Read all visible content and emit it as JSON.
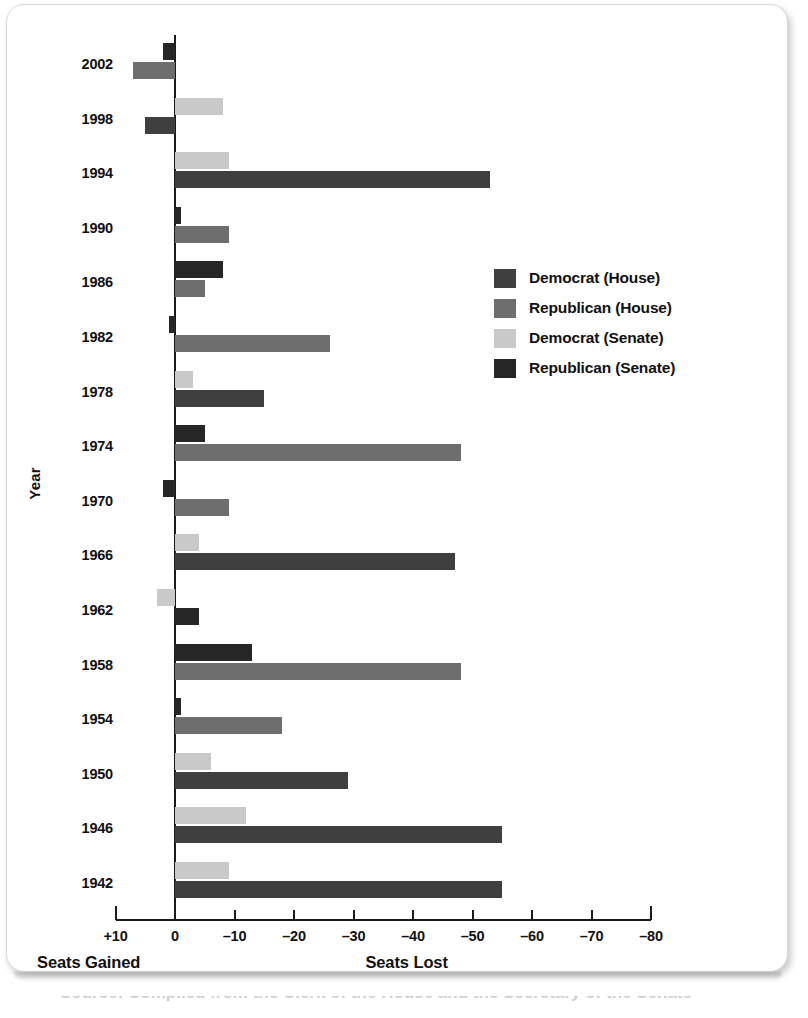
{
  "chart_data": {
    "type": "bar",
    "orientation": "horizontal",
    "title": "",
    "xlabel_left": "Seats Gained",
    "xlabel_right": "Seats Lost",
    "ylabel": "Year",
    "grid": false,
    "legend_position": "right",
    "xtick_labels": [
      "+10",
      "0",
      "–10",
      "–20",
      "–30",
      "–40",
      "–50",
      "–60",
      "–70",
      "–80"
    ],
    "xtick_values": [
      10,
      0,
      -10,
      -20,
      -30,
      -40,
      -50,
      -60,
      -70,
      -80
    ],
    "xlim": [
      10,
      -80
    ],
    "note": "Positive plotted to the left of zero (seats gained); negative plotted to the right (seats lost).",
    "categories": [
      "2002",
      "1998",
      "1994",
      "1990",
      "1986",
      "1982",
      "1978",
      "1974",
      "1970",
      "1966",
      "1962",
      "1958",
      "1954",
      "1950",
      "1946",
      "1942"
    ],
    "series": [
      {
        "name": "Democrat (House)",
        "color": "#3f3f3f",
        "values": [
          null,
          5,
          -53,
          null,
          null,
          null,
          -15,
          null,
          null,
          -47,
          null,
          null,
          null,
          -29,
          -55,
          -55
        ]
      },
      {
        "name": "Republican (House)",
        "color": "#6e6e6e",
        "values": [
          7,
          null,
          null,
          -9,
          -5,
          -26,
          null,
          -48,
          -9,
          null,
          null,
          -48,
          -18,
          null,
          null,
          null
        ]
      },
      {
        "name": "Democrat (Senate)",
        "color": "#c9c9c9",
        "values": [
          null,
          -8,
          -9,
          null,
          null,
          null,
          -3,
          null,
          null,
          -4,
          3,
          null,
          null,
          -6,
          -12,
          -9
        ]
      },
      {
        "name": "Republican (Senate)",
        "color": "#262626",
        "values": [
          2,
          null,
          null,
          -1,
          -8,
          1,
          null,
          -5,
          2,
          null,
          -4,
          -13,
          -1,
          null,
          null,
          null
        ]
      }
    ],
    "bars": [
      {
        "year": "2002",
        "items": [
          {
            "series": "Republican (Senate)",
            "value": 2
          },
          {
            "series": "Republican (House)",
            "value": 7
          }
        ]
      },
      {
        "year": "1998",
        "items": [
          {
            "series": "Democrat (Senate)",
            "value": -8
          },
          {
            "series": "Democrat (House)",
            "value": 5
          }
        ]
      },
      {
        "year": "1994",
        "items": [
          {
            "series": "Democrat (Senate)",
            "value": -9
          },
          {
            "series": "Democrat (House)",
            "value": -53
          }
        ]
      },
      {
        "year": "1990",
        "items": [
          {
            "series": "Republican (Senate)",
            "value": -1
          },
          {
            "series": "Republican (House)",
            "value": -9
          }
        ]
      },
      {
        "year": "1986",
        "items": [
          {
            "series": "Republican (Senate)",
            "value": -8
          },
          {
            "series": "Republican (House)",
            "value": -5
          }
        ]
      },
      {
        "year": "1982",
        "items": [
          {
            "series": "Republican (Senate)",
            "value": 1
          },
          {
            "series": "Republican (House)",
            "value": -26
          }
        ]
      },
      {
        "year": "1978",
        "items": [
          {
            "series": "Democrat (Senate)",
            "value": -3
          },
          {
            "series": "Democrat (House)",
            "value": -15
          }
        ]
      },
      {
        "year": "1974",
        "items": [
          {
            "series": "Republican (Senate)",
            "value": -5
          },
          {
            "series": "Republican (House)",
            "value": -48
          }
        ]
      },
      {
        "year": "1970",
        "items": [
          {
            "series": "Republican (Senate)",
            "value": 2
          },
          {
            "series": "Republican (House)",
            "value": -9
          }
        ]
      },
      {
        "year": "1966",
        "items": [
          {
            "series": "Democrat (Senate)",
            "value": -4
          },
          {
            "series": "Democrat (House)",
            "value": -47
          }
        ]
      },
      {
        "year": "1962",
        "items": [
          {
            "series": "Democrat (Senate)",
            "value": 3
          },
          {
            "series": "Republican (Senate)",
            "value": -4
          }
        ]
      },
      {
        "year": "1958",
        "items": [
          {
            "series": "Republican (Senate)",
            "value": -13
          },
          {
            "series": "Republican (House)",
            "value": -48
          }
        ]
      },
      {
        "year": "1954",
        "items": [
          {
            "series": "Republican (Senate)",
            "value": -1
          },
          {
            "series": "Republican (House)",
            "value": -18
          }
        ]
      },
      {
        "year": "1950",
        "items": [
          {
            "series": "Democrat (Senate)",
            "value": -6
          },
          {
            "series": "Democrat (House)",
            "value": -29
          }
        ]
      },
      {
        "year": "1946",
        "items": [
          {
            "series": "Democrat (Senate)",
            "value": -12
          },
          {
            "series": "Democrat (House)",
            "value": -55
          }
        ]
      },
      {
        "year": "1942",
        "items": [
          {
            "series": "Democrat (Senate)",
            "value": -9
          },
          {
            "series": "Democrat (House)",
            "value": -55
          }
        ]
      }
    ]
  },
  "legend": {
    "items": [
      {
        "label": "Democrat (House)",
        "color": "#3f3f3f"
      },
      {
        "label": "Republican (House)",
        "color": "#6e6e6e"
      },
      {
        "label": "Democrat (Senate)",
        "color": "#c9c9c9"
      },
      {
        "label": "Republican (Senate)",
        "color": "#262626"
      }
    ]
  },
  "axis": {
    "left_caption": "Seats Gained",
    "right_caption": "Seats Lost",
    "y_title": "Year"
  },
  "footer": {
    "clipped_text": "Source: Compiled from the Clerk of the House and the Secretary of the Senate"
  }
}
